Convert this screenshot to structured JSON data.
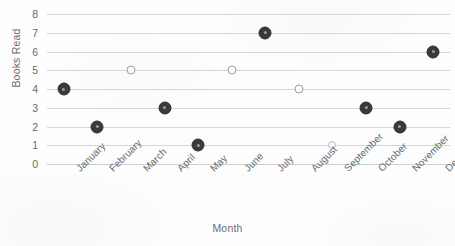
{
  "chart_data": {
    "type": "scatter",
    "title": "",
    "xlabel": "Month",
    "ylabel": "Books Read",
    "categories": [
      "January",
      "February",
      "March",
      "April",
      "May",
      "June",
      "July",
      "August",
      "September",
      "October",
      "November",
      "December"
    ],
    "values": [
      4,
      2,
      5,
      3,
      1,
      5,
      7,
      4,
      1,
      3,
      2,
      6
    ],
    "point_styles": [
      "solid",
      "solid",
      "faint",
      "solid",
      "solid",
      "faint",
      "solid",
      "faint",
      "veryfaint",
      "solid",
      "solid",
      "solid"
    ],
    "ylim": [
      0,
      8
    ],
    "yticks": [
      0,
      1,
      2,
      3,
      4,
      5,
      6,
      7,
      8
    ],
    "ytick_labels": [
      "0",
      "1",
      "2",
      "3",
      "4",
      "5",
      "6",
      "7",
      "8"
    ],
    "grid": true,
    "grid_axis": "y",
    "legend": false,
    "legend_position": "none",
    "colors": {
      "marker_solid": "#3a3a3a",
      "marker_faint": "#9e9e9e",
      "marker_veryfaint": "#bdbdbd",
      "gridline": "#d6d6d6",
      "text": "#6a6a6a",
      "background": "#fdfdfd"
    }
  }
}
